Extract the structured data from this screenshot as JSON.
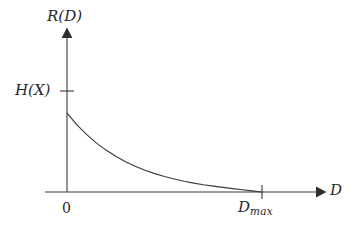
{
  "figure": {
    "caption_type": "rate-distortion-function-plot",
    "background_color": "#ffffff",
    "line_color": "#3a3a3a",
    "text_color": "#262626"
  },
  "labels": {
    "y_axis": "R(D)",
    "x_axis": "D",
    "y_tick": "H(X)",
    "origin": "0",
    "x_tick_base": "D",
    "x_tick_subscript": "max"
  },
  "chart_data": {
    "type": "line",
    "title": "",
    "xlabel": "D",
    "ylabel": "R(D)",
    "grid": false,
    "legend": null,
    "xlim": [
      0,
      1.27
    ],
    "ylim": [
      0,
      1.28
    ],
    "xticks": [
      0,
      1
    ],
    "xticklabels": [
      "0",
      "D_max"
    ],
    "yticks": [
      1
    ],
    "yticklabels": [
      "H(X)"
    ],
    "annotations": [
      {
        "text": "H(X)",
        "x": 0,
        "y": 1,
        "note": "rate at zero distortion equals source entropy"
      },
      {
        "text": "D_max",
        "x": 1,
        "y": 0,
        "note": "distortion at which rate reaches zero"
      }
    ],
    "series": [
      {
        "name": "R(D)",
        "x": [
          0.0,
          0.05,
          0.1,
          0.15,
          0.2,
          0.25,
          0.3,
          0.35,
          0.4,
          0.45,
          0.5,
          0.55,
          0.6,
          0.65,
          0.7,
          0.75,
          0.8,
          0.85,
          0.9,
          0.95,
          1.0
        ],
        "y": [
          1.0,
          0.855,
          0.73,
          0.623,
          0.531,
          0.452,
          0.384,
          0.326,
          0.276,
          0.233,
          0.196,
          0.164,
          0.137,
          0.113,
          0.092,
          0.074,
          0.058,
          0.043,
          0.029,
          0.015,
          0.0
        ]
      }
    ]
  },
  "geometry": {
    "y_axis_x": 67,
    "x_axis_y": 192,
    "x_axis_left": 45,
    "x_axis_right": 318,
    "y_axis_top": 30,
    "h_x_y": 91,
    "d_max_x": 262
  }
}
